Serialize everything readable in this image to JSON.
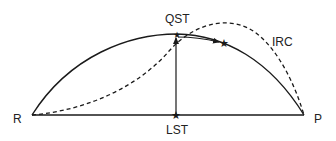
{
  "diagram": {
    "labels": {
      "reactant": "R",
      "product": "P",
      "qst": "QST",
      "lst": "LST",
      "irc": "IRC"
    },
    "colors": {
      "line": "#1a1a1a",
      "background": "#ffffff"
    },
    "elements": {
      "baseline": "solid line from R to P",
      "qst_path": "solid arc from R through QST to P",
      "irc_path": "dashed curve from R to P (intrinsic reaction coordinate)",
      "lst_point": "star marker on baseline",
      "qst_point": "star marker at arc peak",
      "ts_point": "star marker on arc right of QST",
      "arrow_lst_to_qst": "vertical arrow from LST up to QST",
      "arrow_qst_to_ts": "arrow along arc from QST toward TS star"
    }
  }
}
